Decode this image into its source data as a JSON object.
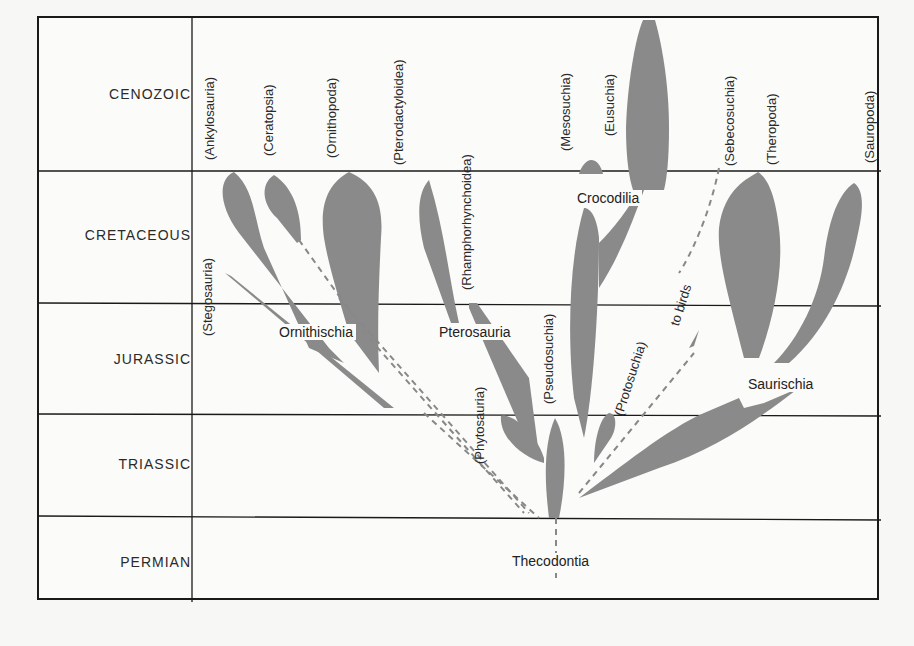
{
  "eras": [
    {
      "label": "CENOZOIC"
    },
    {
      "label": "CRETACEOUS"
    },
    {
      "label": "JURASSIC"
    },
    {
      "label": "TRIASSIC"
    },
    {
      "label": "PERMIAN"
    }
  ],
  "top_labels": [
    {
      "label": "(Ankylosauria)"
    },
    {
      "label": "(Ceratopsia)"
    },
    {
      "label": "(Ornithopoda)"
    },
    {
      "label": "(Pterodactyloidea)"
    },
    {
      "label": "(Mesosuchia)"
    },
    {
      "label": "(Eusuchia)"
    },
    {
      "label": "(Sebecosuchia)"
    },
    {
      "label": "(Theropoda)"
    },
    {
      "label": "(Sauropoda)"
    }
  ],
  "inner_labels": {
    "stegosauria": "(Stegosauria)",
    "rhamphorhynchoidea": "(Rhamphorhynchoidea)",
    "phytosauria": "(Phytosauria)",
    "pseudosuchia": "(Pseudosuchia)",
    "protosuchia": "(Protosuchia)",
    "to_birds": "to birds"
  },
  "group_labels": {
    "ornithischia": "Ornithischia",
    "pterosauria": "Pterosauria",
    "crocodilia": "Crocodilia",
    "saurischia": "Saurischia",
    "thecodontia": "Thecodontia"
  },
  "colors": {
    "branch_fill": "#8a8a8a",
    "grid_line": "#1a1a1a",
    "background": "#fbfbf9"
  }
}
